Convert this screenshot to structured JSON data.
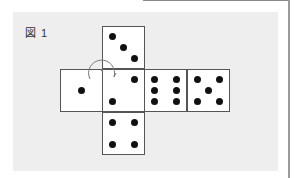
{
  "figure": {
    "label": "図 1"
  },
  "net": {
    "faces": [
      {
        "id": "top",
        "pips": 3,
        "pips_layout": "diagonal"
      },
      {
        "id": "left",
        "pips": 1
      },
      {
        "id": "center",
        "pips": 2,
        "note": "rotated 2 (top-right, bottom-left)"
      },
      {
        "id": "right1",
        "pips": 6
      },
      {
        "id": "right2",
        "pips": 5
      },
      {
        "id": "bottom",
        "pips": 4
      }
    ],
    "rotation_marker": {
      "position": "top-left corner of center face",
      "shape": "circular arrow"
    }
  },
  "colors": {
    "panel": "#eeeeee",
    "face": "#ffffff",
    "border": "#555555",
    "pip": "#111111",
    "arrow": "#777777"
  }
}
